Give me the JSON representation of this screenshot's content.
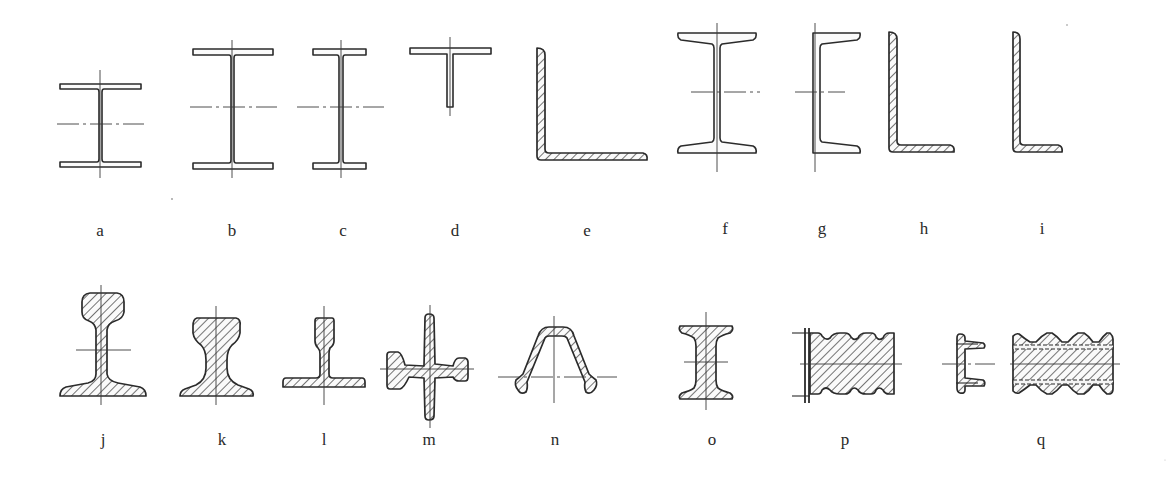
{
  "figure": {
    "colors": {
      "line": "#2b2b2b",
      "background": "#ffffff",
      "label": "#2a2a2a"
    }
  },
  "profiles": [
    {
      "id": "a",
      "label": "a",
      "shape": "i-beam-parallel-flange-short",
      "hatched": false
    },
    {
      "id": "b",
      "label": "b",
      "shape": "i-beam-parallel-flange-tall",
      "hatched": false
    },
    {
      "id": "c",
      "label": "c",
      "shape": "i-beam-parallel-flange-narrow",
      "hatched": false
    },
    {
      "id": "d",
      "label": "d",
      "shape": "t-section",
      "hatched": false
    },
    {
      "id": "e",
      "label": "e",
      "shape": "equal-angle-large",
      "hatched": true
    },
    {
      "id": "f",
      "label": "f",
      "shape": "i-beam-tapered-flange",
      "hatched": false
    },
    {
      "id": "g",
      "label": "g",
      "shape": "channel-tapered-flange",
      "hatched": false
    },
    {
      "id": "h",
      "label": "h",
      "shape": "unequal-angle",
      "hatched": true
    },
    {
      "id": "i",
      "label": "i",
      "shape": "unequal-angle-small",
      "hatched": true
    },
    {
      "id": "j",
      "label": "j",
      "shape": "heavy-rail",
      "hatched": true
    },
    {
      "id": "k",
      "label": "k",
      "shape": "crane-rail",
      "hatched": true
    },
    {
      "id": "l",
      "label": "l",
      "shape": "light-rail",
      "hatched": true
    },
    {
      "id": "m",
      "label": "m",
      "shape": "cross-profile",
      "hatched": true
    },
    {
      "id": "n",
      "label": "n",
      "shape": "omega-sheet-pile",
      "hatched": true
    },
    {
      "id": "o",
      "label": "o",
      "shape": "solid-i-section",
      "hatched": true
    },
    {
      "id": "p",
      "label": "p",
      "shape": "ribbed-flat-bar",
      "hatched": true
    },
    {
      "id": "q",
      "label": "q",
      "shape": "ribbed-channel-and-strip",
      "hatched": true
    }
  ]
}
